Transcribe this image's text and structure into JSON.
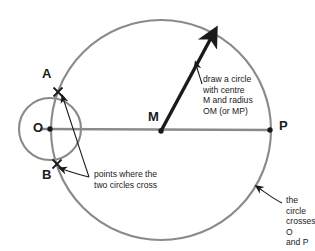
{
  "figure": {
    "background_color": "#ffffff",
    "construction_stroke_color": "#8a8a8a",
    "annotation_color": "#1a1a1a",
    "label_color": "#1a1a1a"
  },
  "points": [
    {
      "id": "O",
      "label": "O",
      "x": 50,
      "y": 129,
      "label_x": 33,
      "label_y": 122,
      "marker": "dot"
    },
    {
      "id": "M",
      "label": "M",
      "x": 161,
      "y": 131,
      "label_x": 148,
      "label_y": 112,
      "marker": "dot"
    },
    {
      "id": "P",
      "label": "P",
      "x": 270,
      "y": 130,
      "label_x": 279,
      "label_y": 121,
      "marker": "dot"
    },
    {
      "id": "A",
      "label": "A",
      "x": 58,
      "y": 92,
      "label_x": 42,
      "label_y": 69,
      "marker": "cross"
    },
    {
      "id": "B",
      "label": "B",
      "x": 57,
      "y": 164,
      "label_x": 42,
      "label_y": 170,
      "marker": "cross"
    }
  ],
  "circles": [
    {
      "id": "small-circle",
      "centre": "O",
      "cx": 50,
      "cy": 129,
      "r": 31
    },
    {
      "id": "big-circle",
      "centre": "M",
      "cx": 161,
      "cy": 130,
      "r": 110
    }
  ],
  "segments": [
    {
      "id": "line-OP",
      "from": "O",
      "to": "P",
      "x1": 40,
      "y1": 129,
      "x2": 272,
      "y2": 130
    }
  ],
  "arrows": [
    {
      "id": "radius-arrow",
      "description": "thick arrow from M outward along the radius",
      "from_x": 161,
      "from_y": 131,
      "to_x": 214,
      "to_y": 32
    },
    {
      "id": "callout-arrow-radius-note",
      "description": "small curved arrow pointing from the radius note up to the arrow shaft",
      "from_x": 202,
      "from_y": 83,
      "to_x": 196,
      "to_y": 64
    },
    {
      "id": "callout-arrow-to-A",
      "description": "thin arrow from the crossing-points note up to point A",
      "from_x": 88,
      "from_y": 176,
      "to_x": 62,
      "to_y": 98
    },
    {
      "id": "callout-arrow-to-B",
      "description": "thin arrow from the crossing-points note to point B",
      "from_x": 88,
      "from_y": 176,
      "to_x": 62,
      "to_y": 169
    },
    {
      "id": "callout-arrow-to-big-circle",
      "description": "thin arrow from the bottom-right note to the big circle",
      "from_x": 281,
      "from_y": 202,
      "to_x": 258,
      "to_y": 187
    }
  ],
  "annotations": [
    {
      "id": "radius-note",
      "text": "draw a circle\nwith centre\nM and radius\nOM (or MP)",
      "x": 203,
      "y": 75
    },
    {
      "id": "crossing-points-note",
      "text": "points where the\ntwo circles cross",
      "x": 94,
      "y": 170
    },
    {
      "id": "big-circle-note",
      "text": "the circle\ncrosses O\nand P",
      "x": 286,
      "y": 196
    }
  ]
}
